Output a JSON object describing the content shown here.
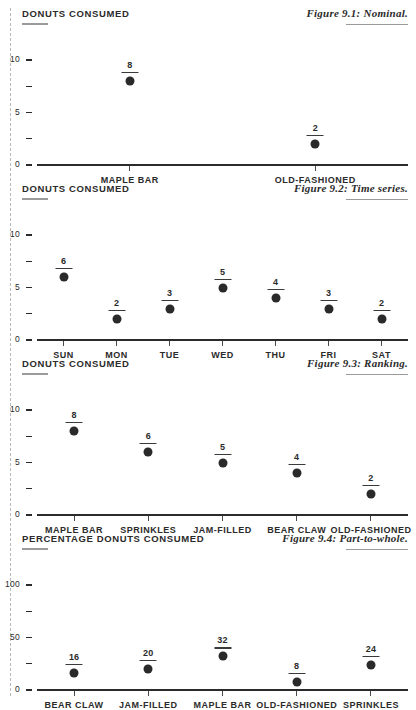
{
  "page": {
    "background": "#ffffff",
    "ink": "#2b2b2b",
    "rule_color": "#9b9b9b",
    "crop_line_color": "#b9b9b9"
  },
  "chart_data": [
    {
      "type": "scatter",
      "id": "figure-9-1",
      "title": "DONUTS CONSUMED",
      "caption": "Figure 9.1: Nominal.",
      "xlabel": "",
      "ylabel": "DONUTS CONSUMED",
      "ylim": [
        0,
        10
      ],
      "yticks": [
        0,
        2.5,
        5,
        7.5,
        10
      ],
      "ytick_labels": [
        "0",
        "",
        "5",
        "",
        "10"
      ],
      "grid": false,
      "legend": "none",
      "categories": [
        "MAPLE BAR",
        "OLD-FASHIONED"
      ],
      "values": [
        8,
        2
      ],
      "value_labels": [
        "8",
        "2"
      ]
    },
    {
      "type": "scatter",
      "id": "figure-9-2",
      "title": "DONUTS CONSUMED",
      "caption": "Figure 9.2: Time series.",
      "xlabel": "",
      "ylabel": "DONUTS CONSUMED",
      "ylim": [
        0,
        10
      ],
      "yticks": [
        0,
        2.5,
        5,
        7.5,
        10
      ],
      "ytick_labels": [
        "0",
        "",
        "5",
        "",
        "10"
      ],
      "grid": false,
      "legend": "none",
      "categories": [
        "SUN",
        "MON",
        "TUE",
        "WED",
        "THU",
        "FRI",
        "SAT"
      ],
      "values": [
        6,
        2,
        3,
        5,
        4,
        3,
        2
      ],
      "value_labels": [
        "6",
        "2",
        "3",
        "5",
        "4",
        "3",
        "2"
      ]
    },
    {
      "type": "scatter",
      "id": "figure-9-3",
      "title": "DONUTS CONSUMED",
      "caption": "Figure 9.3: Ranking.",
      "xlabel": "",
      "ylabel": "DONUTS CONSUMED",
      "ylim": [
        0,
        10
      ],
      "yticks": [
        0,
        2.5,
        5,
        7.5,
        10
      ],
      "ytick_labels": [
        "0",
        "",
        "5",
        "",
        "10"
      ],
      "grid": false,
      "legend": "none",
      "categories": [
        "MAPLE BAR",
        "SPRINKLES",
        "JAM-FILLED",
        "BEAR CLAW",
        "OLD-FASHIONED"
      ],
      "values": [
        8,
        6,
        5,
        4,
        2
      ],
      "value_labels": [
        "8",
        "6",
        "5",
        "4",
        "2"
      ]
    },
    {
      "type": "scatter",
      "id": "figure-9-4",
      "title": "PERCENTAGE DONUTS CONSUMED",
      "caption": "Figure 9.4: Part-to-whole.",
      "xlabel": "",
      "ylabel": "PERCENTAGE DONUTS CONSUMED",
      "ylim": [
        0,
        100
      ],
      "yticks": [
        0,
        25,
        50,
        75,
        100
      ],
      "ytick_labels": [
        "0",
        "",
        "50",
        "",
        "100"
      ],
      "grid": false,
      "legend": "none",
      "categories": [
        "BEAR CLAW",
        "JAM-FILLED",
        "MAPLE BAR",
        "OLD-FASHIONED",
        "SPRINKLES"
      ],
      "values": [
        16,
        20,
        32,
        8,
        24
      ],
      "value_labels": [
        "16",
        "20",
        "32",
        "8",
        "24"
      ]
    }
  ]
}
